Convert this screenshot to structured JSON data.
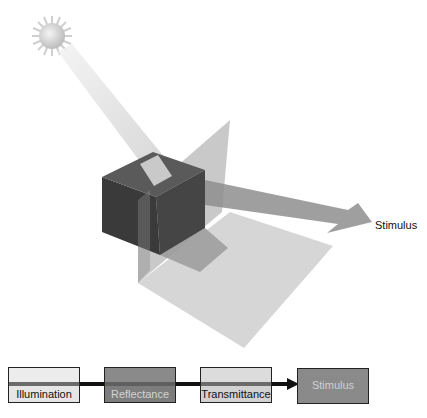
{
  "diagram": {
    "scene": {
      "sun": {
        "name": "sun",
        "cx": 52,
        "cy": 36
      },
      "object": "cube",
      "planes": [
        "vertical-transmitting-plane",
        "floor-shadow-plane"
      ],
      "arrow_label": "Stimulus"
    },
    "flow": {
      "boxes": [
        {
          "label": "Illumination",
          "fill": "#e6e6e6",
          "text_color": "#111111"
        },
        {
          "label": "Reflectance",
          "fill": "#7d7d7d",
          "text_color": "#d4d4d4"
        },
        {
          "label": "Transmittance",
          "fill": "#d2d2d2",
          "text_color": "#111111"
        },
        {
          "label": "Stimulus",
          "fill": "#8a8a8a",
          "text_color": "#d0d0d0"
        }
      ]
    },
    "colors": {
      "cube_dark": "#3e3e3e",
      "beam": "#d8d8d8",
      "plane": "#9a9a9a",
      "arrow": "#8c8c8c",
      "connector": "#111111"
    }
  }
}
